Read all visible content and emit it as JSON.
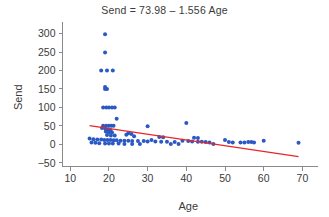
{
  "chart_data": {
    "type": "scatter",
    "title": "Send = 73.98 – 1.556 Age",
    "xlabel": "Age",
    "ylabel": "Send",
    "xlim": [
      8,
      73
    ],
    "ylim": [
      -60,
      315
    ],
    "xticks": [
      10,
      20,
      30,
      40,
      50,
      60,
      70
    ],
    "xtick_labels": [
      "10",
      "20",
      "30",
      "40",
      "50",
      "60",
      "70"
    ],
    "yticks": [
      -50,
      0,
      50,
      100,
      150,
      200,
      250,
      300
    ],
    "ytick_labels": [
      "−50",
      "0",
      "50",
      "100",
      "150",
      "200",
      "250",
      "300"
    ],
    "grid": false,
    "legend": null,
    "point_color": "#2b59c3",
    "line_color": "#e8262a",
    "axis_color": "#8a8a8a",
    "text_color": "#3a3a3a",
    "fit_line": {
      "label": "Send = 73.98 – 1.556 Age",
      "intercept": 73.98,
      "slope": -1.556,
      "x_start": 15,
      "x_end": 69,
      "y_start": 50.64,
      "y_end": -33.38
    },
    "points": [
      {
        "x": 19,
        "y": 298
      },
      {
        "x": 19,
        "y": 249
      },
      {
        "x": 18,
        "y": 200
      },
      {
        "x": 19.5,
        "y": 200
      },
      {
        "x": 21,
        "y": 200
      },
      {
        "x": 19,
        "y": 155
      },
      {
        "x": 19,
        "y": 150
      },
      {
        "x": 19.5,
        "y": 150
      },
      {
        "x": 18.5,
        "y": 100
      },
      {
        "x": 19.3,
        "y": 100
      },
      {
        "x": 20,
        "y": 100
      },
      {
        "x": 20.8,
        "y": 100
      },
      {
        "x": 21.5,
        "y": 100
      },
      {
        "x": 22,
        "y": 69
      },
      {
        "x": 40,
        "y": 58
      },
      {
        "x": 18.5,
        "y": 50
      },
      {
        "x": 19.3,
        "y": 50
      },
      {
        "x": 20,
        "y": 50
      },
      {
        "x": 20.6,
        "y": 50
      },
      {
        "x": 21.2,
        "y": 50
      },
      {
        "x": 30,
        "y": 49
      },
      {
        "x": 18.2,
        "y": 44
      },
      {
        "x": 19,
        "y": 43
      },
      {
        "x": 19.8,
        "y": 40
      },
      {
        "x": 20.4,
        "y": 38
      },
      {
        "x": 19.2,
        "y": 35
      },
      {
        "x": 20,
        "y": 33
      },
      {
        "x": 20.8,
        "y": 32
      },
      {
        "x": 25,
        "y": 30
      },
      {
        "x": 25.8,
        "y": 28
      },
      {
        "x": 24.5,
        "y": 26
      },
      {
        "x": 19.5,
        "y": 25
      },
      {
        "x": 20.5,
        "y": 24
      },
      {
        "x": 21.5,
        "y": 24
      },
      {
        "x": 26.5,
        "y": 22
      },
      {
        "x": 33,
        "y": 20
      },
      {
        "x": 34,
        "y": 19
      },
      {
        "x": 42,
        "y": 18
      },
      {
        "x": 43,
        "y": 17
      },
      {
        "x": 15,
        "y": 16
      },
      {
        "x": 16,
        "y": 14
      },
      {
        "x": 17,
        "y": 13
      },
      {
        "x": 18,
        "y": 13
      },
      {
        "x": 18.8,
        "y": 12
      },
      {
        "x": 19.6,
        "y": 12
      },
      {
        "x": 20.4,
        "y": 12
      },
      {
        "x": 21.2,
        "y": 11
      },
      {
        "x": 22,
        "y": 11
      },
      {
        "x": 23,
        "y": 10
      },
      {
        "x": 24,
        "y": 10
      },
      {
        "x": 25,
        "y": 10
      },
      {
        "x": 26,
        "y": 9
      },
      {
        "x": 27.5,
        "y": 9
      },
      {
        "x": 29,
        "y": 9
      },
      {
        "x": 30,
        "y": 8
      },
      {
        "x": 31,
        "y": 12
      },
      {
        "x": 32,
        "y": 8
      },
      {
        "x": 33.5,
        "y": 7
      },
      {
        "x": 35,
        "y": 7
      },
      {
        "x": 37,
        "y": 6
      },
      {
        "x": 39,
        "y": 10
      },
      {
        "x": 40.5,
        "y": 9
      },
      {
        "x": 41.5,
        "y": 8
      },
      {
        "x": 43,
        "y": 7
      },
      {
        "x": 44,
        "y": 7
      },
      {
        "x": 45,
        "y": 6
      },
      {
        "x": 46,
        "y": 5
      },
      {
        "x": 50,
        "y": 12
      },
      {
        "x": 51,
        "y": 6
      },
      {
        "x": 52,
        "y": 5
      },
      {
        "x": 54,
        "y": 5
      },
      {
        "x": 55,
        "y": 5
      },
      {
        "x": 56,
        "y": 6
      },
      {
        "x": 56.8,
        "y": 6
      },
      {
        "x": 57.5,
        "y": 5
      },
      {
        "x": 60,
        "y": 10
      },
      {
        "x": 69,
        "y": 4
      },
      {
        "x": 15.5,
        "y": 5
      },
      {
        "x": 16.5,
        "y": 4
      },
      {
        "x": 17.5,
        "y": 3
      },
      {
        "x": 19,
        "y": 2
      },
      {
        "x": 20,
        "y": 2
      },
      {
        "x": 21,
        "y": 2
      },
      {
        "x": 22.5,
        "y": 2
      },
      {
        "x": 24,
        "y": 1
      },
      {
        "x": 26,
        "y": 1
      },
      {
        "x": 28,
        "y": 1
      },
      {
        "x": 36,
        "y": 1
      },
      {
        "x": 38,
        "y": 1
      },
      {
        "x": 47,
        "y": 1
      }
    ]
  }
}
